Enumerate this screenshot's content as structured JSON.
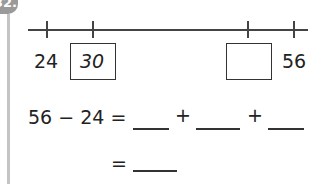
{
  "question": {
    "number": "32.",
    "number_line": {
      "start_label": "24",
      "end_label": "56",
      "boxes": [
        {
          "value": "30"
        },
        {
          "value": ""
        }
      ]
    },
    "equation_line1": {
      "lhs": "56 − 24 =",
      "plus1": "+",
      "plus2": "+"
    },
    "equation_line2": {
      "equals": "="
    }
  }
}
